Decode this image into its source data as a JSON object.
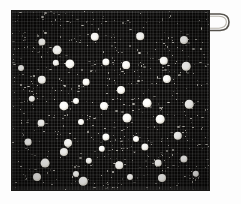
{
  "image": {
    "subject": "polka-dot textile swatch",
    "description": "Dark woven cloth square with scattered white polka dots and a hanging loop at the top right corner",
    "background_color": "#fdfdfd",
    "cloth_color": "#0a0908",
    "dot_color": "#ffffff",
    "loop_color": "#4a4843",
    "cloth_bounds": {
      "left": 12,
      "top": 11,
      "width": 197,
      "height": 179
    }
  },
  "loop": {
    "name": "hanging-loop",
    "left": 203,
    "top": 11,
    "width": 28,
    "height": 22
  },
  "dots": [
    {
      "x": 30,
      "y": 31,
      "r": 3.6
    },
    {
      "x": 83,
      "y": 26,
      "r": 4.2
    },
    {
      "x": 128,
      "y": 25,
      "r": 3.8
    },
    {
      "x": 172,
      "y": 29,
      "r": 4.0
    },
    {
      "x": 45,
      "y": 39,
      "r": 4.4
    },
    {
      "x": 9,
      "y": 57,
      "r": 3.0
    },
    {
      "x": 44,
      "y": 52,
      "r": 3.2
    },
    {
      "x": 58,
      "y": 53,
      "r": 4.6
    },
    {
      "x": 94,
      "y": 51,
      "r": 3.6
    },
    {
      "x": 114,
      "y": 54,
      "r": 3.9
    },
    {
      "x": 152,
      "y": 50,
      "r": 4.2
    },
    {
      "x": 174,
      "y": 55,
      "r": 4.3
    },
    {
      "x": 30,
      "y": 69,
      "r": 4.2
    },
    {
      "x": 74,
      "y": 71,
      "r": 3.4
    },
    {
      "x": 109,
      "y": 79,
      "r": 4.0
    },
    {
      "x": 155,
      "y": 68,
      "r": 4.1
    },
    {
      "x": 20,
      "y": 88,
      "r": 3.2
    },
    {
      "x": 64,
      "y": 90,
      "r": 3.0
    },
    {
      "x": 52,
      "y": 95,
      "r": 4.6
    },
    {
      "x": 92,
      "y": 95,
      "r": 4.0
    },
    {
      "x": 135,
      "y": 92,
      "r": 4.4
    },
    {
      "x": 177,
      "y": 93,
      "r": 4.3
    },
    {
      "x": 29,
      "y": 112,
      "r": 3.4
    },
    {
      "x": 69,
      "y": 111,
      "r": 3.0
    },
    {
      "x": 115,
      "y": 107,
      "r": 4.5
    },
    {
      "x": 148,
      "y": 108,
      "r": 4.3
    },
    {
      "x": 16,
      "y": 131,
      "r": 3.4
    },
    {
      "x": 56,
      "y": 132,
      "r": 4.0
    },
    {
      "x": 94,
      "y": 126,
      "r": 3.6
    },
    {
      "x": 124,
      "y": 128,
      "r": 3.0
    },
    {
      "x": 166,
      "y": 125,
      "r": 4.2
    },
    {
      "x": 52,
      "y": 141,
      "r": 4.1
    },
    {
      "x": 90,
      "y": 138,
      "r": 3.2
    },
    {
      "x": 133,
      "y": 136,
      "r": 3.6
    },
    {
      "x": 172,
      "y": 148,
      "r": 3.6
    },
    {
      "x": 33,
      "y": 152,
      "r": 4.4
    },
    {
      "x": 77,
      "y": 150,
      "r": 3.2
    },
    {
      "x": 107,
      "y": 154,
      "r": 3.8
    },
    {
      "x": 146,
      "y": 152,
      "r": 3.4
    },
    {
      "x": 25,
      "y": 166,
      "r": 4.0
    },
    {
      "x": 64,
      "y": 163,
      "r": 3.0
    },
    {
      "x": 71,
      "y": 170,
      "r": 4.3
    },
    {
      "x": 118,
      "y": 166,
      "r": 3.0
    },
    {
      "x": 150,
      "y": 167,
      "r": 4.0
    },
    {
      "x": 184,
      "y": 163,
      "r": 3.2
    }
  ],
  "texture": {
    "speckle_count": 620,
    "speckle_color": "#f2efe6",
    "weave": "plain-weave cross-hatch"
  }
}
